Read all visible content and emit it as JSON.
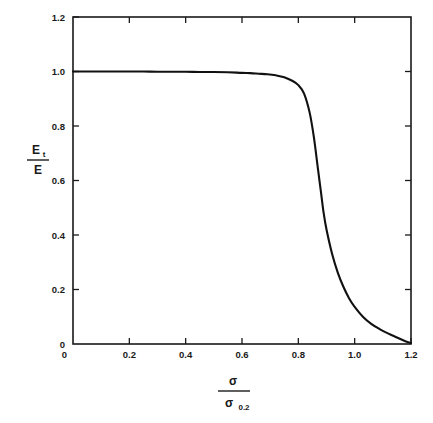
{
  "chart_data": {
    "type": "line",
    "title": "",
    "subtitle": "",
    "xlabel": "σ / σ₀.₂",
    "xlabel_parts": {
      "numerator": "σ",
      "denominator_base": "σ",
      "denominator_sub": "0.2"
    },
    "ylabel": "Eₜ / E",
    "ylabel_parts": {
      "numerator_base": "E",
      "numerator_sub": "t",
      "denominator": "E"
    },
    "xlim": [
      0,
      1.2
    ],
    "ylim": [
      0,
      1.2
    ],
    "xticks": [
      0,
      0.2,
      0.4,
      0.6,
      0.8,
      1.0,
      1.2
    ],
    "yticks": [
      0,
      0.2,
      0.4,
      0.6,
      0.8,
      1.0,
      1.2
    ],
    "xticklabels": [
      "0",
      "0.2",
      "0.4",
      "0.6",
      "0.8",
      "1.0",
      "1.2"
    ],
    "yticklabels": [
      "0",
      "0.2",
      "0.4",
      "0.6",
      "0.8",
      "1.0",
      "1.2"
    ],
    "grid": false,
    "legend": null,
    "legend_position": "none",
    "line_color": "#111111",
    "frame_color": "#1a1a1a",
    "background_color": "#ffffff",
    "annotations": [],
    "series": [
      {
        "name": "Tangent modulus ratio",
        "x": [
          0.0,
          0.05,
          0.1,
          0.15,
          0.2,
          0.25,
          0.3,
          0.35,
          0.4,
          0.45,
          0.5,
          0.55,
          0.6,
          0.63,
          0.66,
          0.69,
          0.72,
          0.75,
          0.78,
          0.8,
          0.82,
          0.84,
          0.855,
          0.87,
          0.88,
          0.89,
          0.9,
          0.92,
          0.94,
          0.96,
          0.98,
          1.0,
          1.03,
          1.06,
          1.09,
          1.12,
          1.15,
          1.18,
          1.2
        ],
        "y": [
          1.0,
          1.0,
          1.0,
          1.0,
          1.0,
          1.0,
          0.999,
          0.999,
          0.999,
          0.998,
          0.998,
          0.997,
          0.995,
          0.994,
          0.992,
          0.99,
          0.986,
          0.979,
          0.965,
          0.95,
          0.92,
          0.85,
          0.76,
          0.64,
          0.56,
          0.48,
          0.42,
          0.33,
          0.262,
          0.21,
          0.168,
          0.136,
          0.099,
          0.073,
          0.054,
          0.038,
          0.024,
          0.01,
          0.004
        ]
      }
    ]
  },
  "plot_geometry": {
    "left": 73,
    "right": 411,
    "top": 17,
    "bottom": 344
  }
}
